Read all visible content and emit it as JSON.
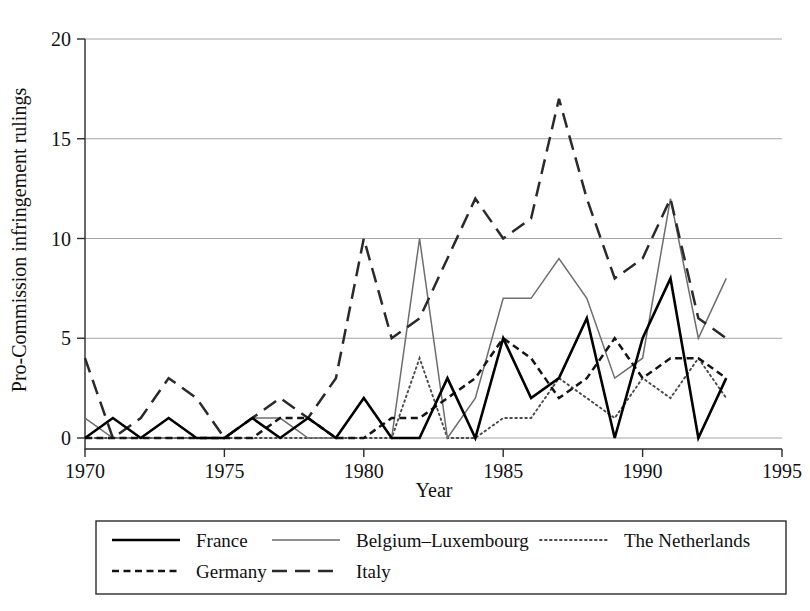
{
  "figure": {
    "background": "#ffffff",
    "ink": "#111111"
  },
  "chart_data": {
    "type": "line",
    "title": "",
    "xlabel": "Year",
    "ylabel": "Pro-Commission infringement rulings",
    "xlim": [
      1970,
      1995
    ],
    "ylim": [
      0,
      20
    ],
    "xticks": [
      1970,
      1975,
      1980,
      1985,
      1990,
      1995
    ],
    "yticks": [
      0,
      5,
      10,
      15,
      20
    ],
    "grid": "horizontal",
    "legend_position": "below-axes",
    "x": [
      1970,
      1971,
      1972,
      1973,
      1974,
      1975,
      1976,
      1977,
      1978,
      1979,
      1980,
      1981,
      1982,
      1983,
      1984,
      1985,
      1986,
      1987,
      1988,
      1989,
      1990,
      1991,
      1992,
      1993
    ],
    "series": [
      {
        "name": "France",
        "style": "solid",
        "color": "#000000",
        "values": [
          0,
          1,
          0,
          1,
          0,
          0,
          1,
          0,
          1,
          0,
          2,
          0,
          0,
          3,
          0,
          5,
          2,
          3,
          6,
          0,
          5,
          8,
          0,
          3
        ]
      },
      {
        "name": "Belgium-Luxembourg",
        "label": "Belgium–Luxembourg",
        "style": "thin-solid",
        "color": "#6d6d6d",
        "values": [
          1,
          0,
          0,
          0,
          0,
          0,
          1,
          1,
          0,
          0,
          2,
          0,
          10,
          0,
          2,
          7,
          7,
          9,
          7,
          3,
          4,
          12,
          5,
          8
        ]
      },
      {
        "name": "The Netherlands",
        "style": "dotted",
        "color": "#4a4a4a",
        "values": [
          0,
          0,
          0,
          0,
          0,
          0,
          0,
          0,
          0,
          0,
          0,
          0,
          4,
          0,
          0,
          1,
          1,
          3,
          2,
          1,
          3,
          2,
          4,
          2
        ]
      },
      {
        "name": "Germany",
        "style": "dashed",
        "color": "#141414",
        "values": [
          0,
          0,
          0,
          0,
          0,
          0,
          0,
          1,
          1,
          0,
          0,
          1,
          1,
          2,
          3,
          5,
          4,
          2,
          3,
          5,
          3,
          4,
          4,
          3
        ]
      },
      {
        "name": "Italy",
        "style": "long-dashed",
        "color": "#2a2a2a",
        "values": [
          4,
          0,
          1,
          3,
          2,
          0,
          1,
          2,
          1,
          3,
          10,
          5,
          6,
          9,
          12,
          10,
          11,
          17,
          12,
          8,
          9,
          12,
          6,
          5
        ]
      }
    ]
  },
  "legend": {
    "entries": [
      {
        "label": "France",
        "key": "france"
      },
      {
        "label": "Belgium–Luxembourg",
        "key": "belgium"
      },
      {
        "label": "The Netherlands",
        "key": "netherlands"
      },
      {
        "label": "Germany",
        "key": "germany"
      },
      {
        "label": "Italy",
        "key": "italy"
      }
    ]
  },
  "axis": {
    "x_title": "Year",
    "y_title": "Pro-Commission infringement rulings",
    "x_tick_labels": [
      "1970",
      "1975",
      "1980",
      "1985",
      "1990",
      "1995"
    ],
    "y_tick_labels": [
      "0",
      "5",
      "10",
      "15",
      "20"
    ]
  }
}
